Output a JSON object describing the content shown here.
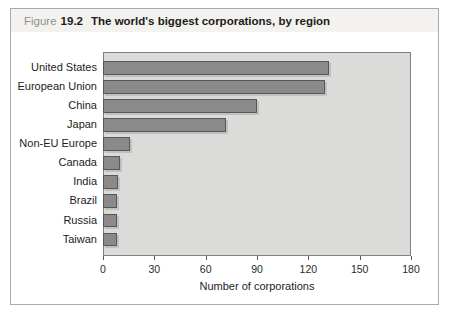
{
  "figure": {
    "label": "Figure",
    "number": "19.2",
    "title": "The world's biggest corporations, by region"
  },
  "chart_data": {
    "type": "bar",
    "orientation": "horizontal",
    "categories": [
      "United States",
      "European Union",
      "China",
      "Japan",
      "Non-EU Europe",
      "Canada",
      "India",
      "Brazil",
      "Russia",
      "Taiwan"
    ],
    "values": [
      132,
      130,
      90,
      72,
      16,
      10,
      9,
      8,
      8,
      8
    ],
    "title": "The world's biggest corporations, by region",
    "xlabel": "Number of corporations",
    "ylabel": "",
    "xlim": [
      0,
      180
    ],
    "x_ticks": [
      0,
      30,
      60,
      90,
      120,
      150,
      180
    ],
    "grid": false,
    "legend": false,
    "colors": {
      "bar_fill": "#8a8a8a",
      "bar_border": "#575757",
      "bar_shadow": "#c0c0be",
      "plot_background": "#dbdbd9",
      "plot_border": "#808080",
      "header_strip": "#f3f2ef",
      "figure_word": "#909090",
      "text": "#1c1c1c"
    }
  }
}
